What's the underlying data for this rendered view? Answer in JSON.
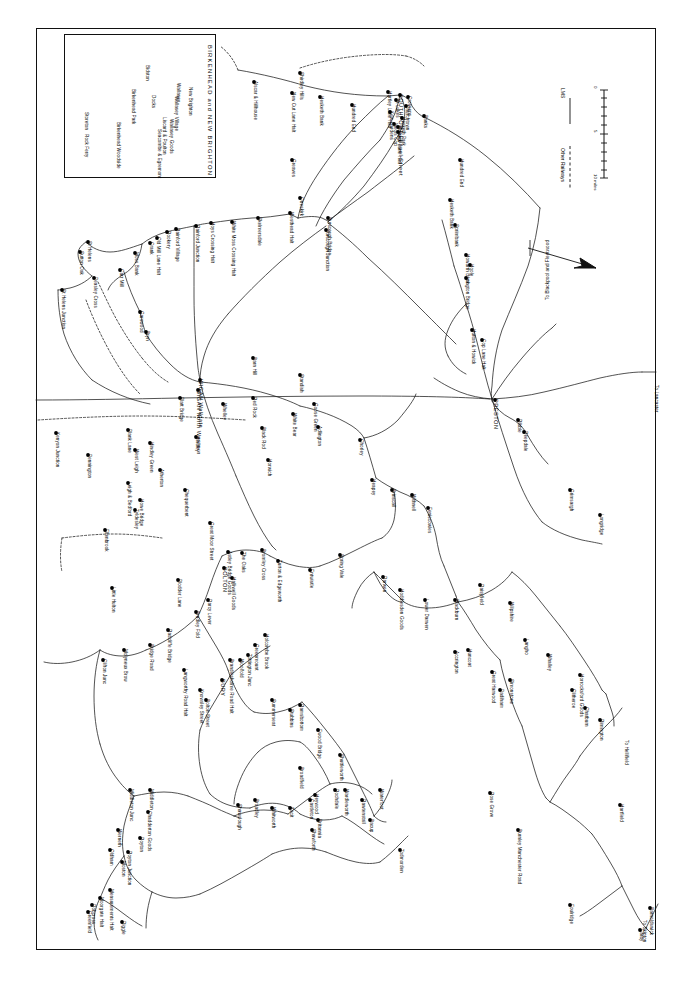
{
  "map": {
    "title": "LMS Railway System — Lancashire",
    "inset_title": "BIRKENHEAD  and  NEW  BRIGHTON",
    "legend": {
      "lms_label": "LMS",
      "other_label": "Other Railways",
      "scale_zero": "0",
      "scale_mid": "5",
      "scale_end": "10 miles"
    },
    "edge_notes": [
      {
        "text": "To Blackpool and Fleetwood"
      },
      {
        "text": "To Lancaster"
      },
      {
        "text": "To Hellifield"
      },
      {
        "text": "To Skipton"
      }
    ],
    "major_stations": [
      "SOUTHPORT",
      "PRESTON",
      "WIGAN",
      "BOLTON",
      "BURY",
      "BLACKBURN",
      "ROCHDALE",
      "OLDHAM",
      "ACCRINGTON",
      "BURNLEY"
    ],
    "stations": [
      {
        "name": "Storeton",
        "x": 85,
        "y": 113
      },
      {
        "name": "Rock Ferry",
        "x": 85,
        "y": 135
      },
      {
        "name": "Birkenhead Woodside",
        "x": 117,
        "y": 123
      },
      {
        "name": "Birkenhead Park",
        "x": 132,
        "y": 90
      },
      {
        "name": "Bidston",
        "x": 146,
        "y": 66
      },
      {
        "name": "Docks",
        "x": 152,
        "y": 96
      },
      {
        "name": "Seacombe & Egremont",
        "x": 158,
        "y": 130
      },
      {
        "name": "Liscard & Poulton",
        "x": 163,
        "y": 118
      },
      {
        "name": "Wallasey Goods",
        "x": 170,
        "y": 120
      },
      {
        "name": "Wallasey Village",
        "x": 175,
        "y": 97
      },
      {
        "name": "Wallasey",
        "x": 177,
        "y": 84
      },
      {
        "name": "New Brighton",
        "x": 189,
        "y": 88
      },
      {
        "name": "Alscar & Hillhouse",
        "x": 254,
        "y": 82
      },
      {
        "name": "New Cut Lane Halt",
        "x": 292,
        "y": 93
      },
      {
        "name": "Hesketh Bank",
        "x": 320,
        "y": 97
      },
      {
        "name": "Shirdley Hills",
        "x": 300,
        "y": 73
      },
      {
        "name": "Hundred End",
        "x": 352,
        "y": 105
      },
      {
        "name": "Crossens",
        "x": 408,
        "y": 97
      },
      {
        "name": "Churchtown",
        "x": 406,
        "y": 106
      },
      {
        "name": "Hesketh Park",
        "x": 402,
        "y": 118
      },
      {
        "name": "SOUTHPORT Chapel Street",
        "x": 400,
        "y": 95
      },
      {
        "name": "St Lukes",
        "x": 396,
        "y": 100
      },
      {
        "name": "Blowick",
        "x": 398,
        "y": 127
      },
      {
        "name": "Meols Cop",
        "x": 394,
        "y": 124
      },
      {
        "name": "Burts Lane Halt",
        "x": 398,
        "y": 132
      },
      {
        "name": "Kew Gardens",
        "x": 390,
        "y": 112
      },
      {
        "name": "Hartley Lane Halt",
        "x": 388,
        "y": 92
      },
      {
        "name": "Banks",
        "x": 424,
        "y": 116
      },
      {
        "name": "Hundred End",
        "x": 460,
        "y": 160
      },
      {
        "name": "Greaves",
        "x": 292,
        "y": 160
      },
      {
        "name": "Westhead Halt",
        "x": 290,
        "y": 213
      },
      {
        "name": "Skelmersdale",
        "x": 258,
        "y": 218
      },
      {
        "name": "White Moss Crossing Halt",
        "x": 232,
        "y": 222
      },
      {
        "name": "Hoys Crossing Halt",
        "x": 211,
        "y": 223
      },
      {
        "name": "Rainford Junction",
        "x": 196,
        "y": 226
      },
      {
        "name": "Rainford Village",
        "x": 176,
        "y": 229
      },
      {
        "name": "Rookery",
        "x": 167,
        "y": 232
      },
      {
        "name": "Old Mill Lane Halt",
        "x": 157,
        "y": 238
      },
      {
        "name": "Crank",
        "x": 150,
        "y": 243
      },
      {
        "name": "Moss Bank",
        "x": 135,
        "y": 253
      },
      {
        "name": "Carr Mill",
        "x": 120,
        "y": 270
      },
      {
        "name": "St Helens",
        "x": 88,
        "y": 242
      },
      {
        "name": "Sutton Oak",
        "x": 80,
        "y": 252
      },
      {
        "name": "Peasley Cross",
        "x": 94,
        "y": 278
      },
      {
        "name": "St Helens Junction",
        "x": 62,
        "y": 290
      },
      {
        "name": "Garswood",
        "x": 140,
        "y": 312
      },
      {
        "name": "Bryn",
        "x": 146,
        "y": 332
      },
      {
        "name": "Burscough Bridge",
        "x": 328,
        "y": 218
      },
      {
        "name": "Burscough Junction",
        "x": 326,
        "y": 230
      },
      {
        "name": "Ormskirk",
        "x": 300,
        "y": 198
      },
      {
        "name": "Barn Hill",
        "x": 253,
        "y": 358
      },
      {
        "name": "Standish",
        "x": 300,
        "y": 375
      },
      {
        "name": "WIGAN Wallgate",
        "x": 200,
        "y": 380
      },
      {
        "name": "WIGAN North Western",
        "x": 198,
        "y": 390
      },
      {
        "name": "Whelley",
        "x": 223,
        "y": 404
      },
      {
        "name": "Red Rock",
        "x": 253,
        "y": 398
      },
      {
        "name": "Black Rod",
        "x": 262,
        "y": 428
      },
      {
        "name": "White Bear",
        "x": 293,
        "y": 414
      },
      {
        "name": "Adlington",
        "x": 318,
        "y": 427
      },
      {
        "name": "Goose Green",
        "x": 314,
        "y": 404
      },
      {
        "name": "Horwich",
        "x": 268,
        "y": 460
      },
      {
        "name": "Hindley",
        "x": 196,
        "y": 437
      },
      {
        "name": "Hindley Green",
        "x": 150,
        "y": 443
      },
      {
        "name": "Plank Lane",
        "x": 128,
        "y": 430
      },
      {
        "name": "West Leigh",
        "x": 135,
        "y": 450
      },
      {
        "name": "Kenyon Junction",
        "x": 56,
        "y": 433
      },
      {
        "name": "Pennington",
        "x": 88,
        "y": 455
      },
      {
        "name": "Leigh & Bedford",
        "x": 128,
        "y": 483
      },
      {
        "name": "Howe Bridge",
        "x": 140,
        "y": 500
      },
      {
        "name": "Atherton",
        "x": 160,
        "y": 470
      },
      {
        "name": "Tyldesley",
        "x": 135,
        "y": 510
      },
      {
        "name": "Ellenbrook",
        "x": 105,
        "y": 530
      },
      {
        "name": "Chequerbent",
        "x": 185,
        "y": 490
      },
      {
        "name": "Platt Bridge",
        "x": 180,
        "y": 398
      },
      {
        "name": "Little Hulton",
        "x": 112,
        "y": 588
      },
      {
        "name": "Plodder Lane",
        "x": 178,
        "y": 580
      },
      {
        "name": "Great Moor Street",
        "x": 210,
        "y": 523
      },
      {
        "name": "Astley Bridge Goods",
        "x": 228,
        "y": 552
      },
      {
        "name": "BOLTON",
        "x": 224,
        "y": 568
      },
      {
        "name": "Halliwell Goods",
        "x": 232,
        "y": 578
      },
      {
        "name": "The Oaks",
        "x": 242,
        "y": 553
      },
      {
        "name": "Bromley Cross",
        "x": 262,
        "y": 550
      },
      {
        "name": "Turton & Edgeworth",
        "x": 278,
        "y": 561
      },
      {
        "name": "Entwistle",
        "x": 310,
        "y": 570
      },
      {
        "name": "Spring Vale",
        "x": 340,
        "y": 555
      },
      {
        "name": "Darcy Lever",
        "x": 208,
        "y": 600
      },
      {
        "name": "Bradley Fold",
        "x": 196,
        "y": 612
      },
      {
        "name": "Radcliffe Bridge",
        "x": 168,
        "y": 630
      },
      {
        "name": "Bridge Road",
        "x": 150,
        "y": 645
      },
      {
        "name": "Molyneux Brow",
        "x": 124,
        "y": 650
      },
      {
        "name": "Clifton Junc",
        "x": 103,
        "y": 660
      },
      {
        "name": "Langworthy Road Halt",
        "x": 184,
        "y": 670
      },
      {
        "name": "Knowsley Street",
        "x": 200,
        "y": 690
      },
      {
        "name": "Bolton Street",
        "x": 206,
        "y": 700
      },
      {
        "name": "BURY",
        "x": 222,
        "y": 680
      },
      {
        "name": "Brandlesholme Road Halt",
        "x": 230,
        "y": 660
      },
      {
        "name": "Woolfold",
        "x": 240,
        "y": 660
      },
      {
        "name": "Tottington Junc",
        "x": 248,
        "y": 655
      },
      {
        "name": "Greenmount",
        "x": 255,
        "y": 645
      },
      {
        "name": "Holcombe Brook",
        "x": 265,
        "y": 635
      },
      {
        "name": "Summerseat",
        "x": 272,
        "y": 700
      },
      {
        "name": "Stubbins",
        "x": 290,
        "y": 710
      },
      {
        "name": "Ramsbottom",
        "x": 300,
        "y": 705
      },
      {
        "name": "Ewood Bridge",
        "x": 318,
        "y": 730
      },
      {
        "name": "Shuttleworth",
        "x": 340,
        "y": 755
      },
      {
        "name": "Rawtenstall",
        "x": 362,
        "y": 800
      },
      {
        "name": "Waterfoot",
        "x": 380,
        "y": 790
      },
      {
        "name": "Bacup",
        "x": 370,
        "y": 820
      },
      {
        "name": "Broadfield",
        "x": 300,
        "y": 768
      },
      {
        "name": "Heywood",
        "x": 315,
        "y": 795
      },
      {
        "name": "Castleton",
        "x": 310,
        "y": 800
      },
      {
        "name": "Rochdale",
        "x": 335,
        "y": 790
      },
      {
        "name": "Wardleworth",
        "x": 345,
        "y": 790
      },
      {
        "name": "Shawclough",
        "x": 238,
        "y": 805
      },
      {
        "name": "Broadley",
        "x": 255,
        "y": 800
      },
      {
        "name": "Whitworth",
        "x": 272,
        "y": 808
      },
      {
        "name": "Facit",
        "x": 290,
        "y": 808
      },
      {
        "name": "Britannia",
        "x": 318,
        "y": 820
      },
      {
        "name": "Shawforth",
        "x": 312,
        "y": 830
      },
      {
        "name": "Todmorden",
        "x": 400,
        "y": 850
      },
      {
        "name": "Middleton Junc",
        "x": 130,
        "y": 790
      },
      {
        "name": "Middleton",
        "x": 150,
        "y": 790
      },
      {
        "name": "Chadderton Goods",
        "x": 148,
        "y": 812
      },
      {
        "name": "Werneth",
        "x": 118,
        "y": 830
      },
      {
        "name": "Oldham",
        "x": 110,
        "y": 850
      },
      {
        "name": "Royton",
        "x": 140,
        "y": 838
      },
      {
        "name": "Royton Junction",
        "x": 128,
        "y": 852
      },
      {
        "name": "Moston",
        "x": 122,
        "y": 862
      },
      {
        "name": "Measurements Halt",
        "x": 110,
        "y": 890
      },
      {
        "name": "Moorgate Halt",
        "x": 100,
        "y": 898
      },
      {
        "name": "Dobcross",
        "x": 92,
        "y": 905
      },
      {
        "name": "Greenfield",
        "x": 88,
        "y": 912
      },
      {
        "name": "Diggle",
        "x": 122,
        "y": 922
      },
      {
        "name": "Chorley",
        "x": 360,
        "y": 440
      },
      {
        "name": "Heapey",
        "x": 372,
        "y": 480
      },
      {
        "name": "Brinscall",
        "x": 392,
        "y": 490
      },
      {
        "name": "Withnell",
        "x": 412,
        "y": 495
      },
      {
        "name": "Feniscowles",
        "x": 428,
        "y": 508
      },
      {
        "name": "Darwen",
        "x": 383,
        "y": 577
      },
      {
        "name": "Lower Darwen",
        "x": 425,
        "y": 600
      },
      {
        "name": "Hoddlesden Goods",
        "x": 400,
        "y": 590
      },
      {
        "name": "Blackburn",
        "x": 455,
        "y": 600
      },
      {
        "name": "Daisyfield",
        "x": 480,
        "y": 585
      },
      {
        "name": "Wilpshire",
        "x": 510,
        "y": 603
      },
      {
        "name": "Langho",
        "x": 525,
        "y": 640
      },
      {
        "name": "Whalley",
        "x": 548,
        "y": 655
      },
      {
        "name": "Clitheroe",
        "x": 572,
        "y": 690
      },
      {
        "name": "Horrocksford Goods",
        "x": 580,
        "y": 675
      },
      {
        "name": "Chatburn",
        "x": 585,
        "y": 708
      },
      {
        "name": "Rimington",
        "x": 600,
        "y": 720
      },
      {
        "name": "Accrington",
        "x": 455,
        "y": 652
      },
      {
        "name": "Great Harwood",
        "x": 492,
        "y": 672
      },
      {
        "name": "Padiham",
        "x": 500,
        "y": 690
      },
      {
        "name": "Simonstone",
        "x": 510,
        "y": 680
      },
      {
        "name": "Huncoat",
        "x": 468,
        "y": 650
      },
      {
        "name": "Rose Grove",
        "x": 490,
        "y": 793
      },
      {
        "name": "Burnley Manchester Road",
        "x": 518,
        "y": 830
      },
      {
        "name": "Barnoldswick",
        "x": 650,
        "y": 908
      },
      {
        "name": "Earby",
        "x": 640,
        "y": 930
      },
      {
        "name": "Foulridge",
        "x": 570,
        "y": 905
      },
      {
        "name": "Hartfield",
        "x": 620,
        "y": 805
      },
      {
        "name": "Longridge",
        "x": 600,
        "y": 515
      },
      {
        "name": "Grimsargh",
        "x": 570,
        "y": 490
      },
      {
        "name": "PRESTON",
        "x": 495,
        "y": 400
      },
      {
        "name": "Ribble",
        "x": 518,
        "y": 420
      },
      {
        "name": "Deepdale",
        "x": 524,
        "y": 432
      },
      {
        "name": "Cop Lane Halt",
        "x": 482,
        "y": 340
      },
      {
        "name": "Hutton & Howick",
        "x": 472,
        "y": 330
      },
      {
        "name": "Longton Bridge",
        "x": 466,
        "y": 278
      },
      {
        "name": "Hoole",
        "x": 470,
        "y": 265
      },
      {
        "name": "Howarth Bank",
        "x": 466,
        "y": 255
      },
      {
        "name": "Sprimbank",
        "x": 455,
        "y": 225
      },
      {
        "name": "Hesketh Bank",
        "x": 450,
        "y": 200
      }
    ]
  }
}
